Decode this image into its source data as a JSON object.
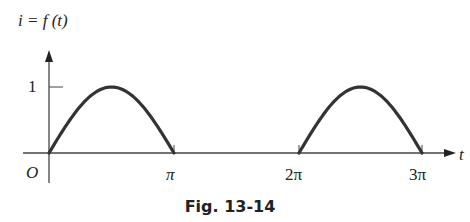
{
  "caption": "Fig. 13-14",
  "chart_data": {
    "type": "line",
    "title": "Fig. 13-14",
    "ylabel": "i = f(t)",
    "xlabel": "t",
    "x_ticks": [
      "O",
      "π",
      "2π",
      "3π"
    ],
    "y_ticks": [
      "1"
    ],
    "xlim": [
      0,
      3.3
    ],
    "ylim": [
      0,
      1.2
    ],
    "series": [
      {
        "name": "f(t)",
        "segments": [
          {
            "x": [
              0,
              0.5,
              1.0,
              1.5,
              2.0,
              2.5,
              3.0
            ],
            "unit": "π",
            "y": [
              0,
              0.707,
              1,
              0.707,
              0,
              0,
              0
            ],
            "note": "sin(t) on [0,π]"
          },
          {
            "x_range": [
              "2π",
              "3π"
            ],
            "y": "sin(t), peak 1 at 2.5π"
          }
        ]
      }
    ],
    "grid": false
  },
  "labels": {
    "y_axis": "i = f (t)",
    "x_axis": "t",
    "origin": "O",
    "tick_1": "1",
    "pi": "π",
    "two_pi": "2π",
    "three_pi": "3π"
  }
}
